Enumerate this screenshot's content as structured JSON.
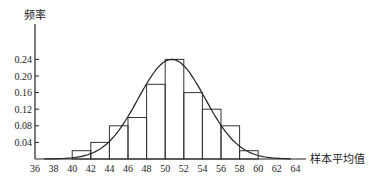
{
  "chart_data": {
    "type": "bar",
    "title": "",
    "xlabel": "样本平均值",
    "ylabel": "频率",
    "x_ticks": [
      36,
      38,
      40,
      42,
      44,
      46,
      48,
      50,
      52,
      54,
      56,
      58,
      60,
      62,
      64
    ],
    "y_ticks": [
      0.04,
      0.08,
      0.12,
      0.16,
      0.2,
      0.24
    ],
    "y_tick_labels": [
      "0.04",
      "0.08",
      "0.12",
      "0.16",
      "0.20",
      "0.24"
    ],
    "xlim": [
      36,
      65
    ],
    "ylim": [
      0,
      0.28
    ],
    "bin_width": 2,
    "categories": [
      "40-42",
      "42-44",
      "44-46",
      "46-48",
      "48-50",
      "50-52",
      "52-54",
      "54-56",
      "56-58",
      "58-60"
    ],
    "bins": [
      {
        "from": 40,
        "to": 42,
        "value": 0.02
      },
      {
        "from": 42,
        "to": 44,
        "value": 0.04
      },
      {
        "from": 44,
        "to": 46,
        "value": 0.08
      },
      {
        "from": 46,
        "to": 48,
        "value": 0.1
      },
      {
        "from": 48,
        "to": 50,
        "value": 0.18
      },
      {
        "from": 50,
        "to": 52,
        "value": 0.24
      },
      {
        "from": 52,
        "to": 54,
        "value": 0.16
      },
      {
        "from": 54,
        "to": 56,
        "value": 0.12
      },
      {
        "from": 56,
        "to": 58,
        "value": 0.08
      },
      {
        "from": 58,
        "to": 60,
        "value": 0.02
      }
    ],
    "values": [
      0.02,
      0.04,
      0.08,
      0.1,
      0.18,
      0.24,
      0.16,
      0.12,
      0.08,
      0.02
    ],
    "overlay_curve": {
      "type": "density-curve",
      "peak_x": 50.7,
      "peak_y": 0.24,
      "spread": 3.6
    },
    "grid": false,
    "legend": null
  },
  "labels": {
    "y_axis_title": "频率",
    "x_axis_title": "样本平均值"
  }
}
